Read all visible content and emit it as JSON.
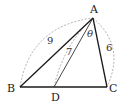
{
  "diagram": {
    "type": "triangle",
    "vertices": {
      "A": {
        "label": "A",
        "x": 93,
        "y": 18
      },
      "B": {
        "label": "B",
        "x": 20,
        "y": 87
      },
      "C": {
        "label": "C",
        "x": 107,
        "y": 87
      },
      "D": {
        "label": "D",
        "x": 54,
        "y": 87
      }
    },
    "segments": [
      {
        "from": "A",
        "to": "B",
        "style": "solid"
      },
      {
        "from": "B",
        "to": "C",
        "style": "solid"
      },
      {
        "from": "C",
        "to": "A",
        "style": "solid"
      },
      {
        "from": "A",
        "to": "D",
        "style": "solid-thin"
      }
    ],
    "lengths": {
      "AB": "9",
      "AD": "7",
      "AC": "6"
    },
    "angle": {
      "label": "θ",
      "between": [
        "AD",
        "AC"
      ],
      "vertex": "A"
    },
    "colors": {
      "line": "#1a1a1a",
      "dashed_arc": "#9a9a9a",
      "background": "#ffffff"
    }
  }
}
